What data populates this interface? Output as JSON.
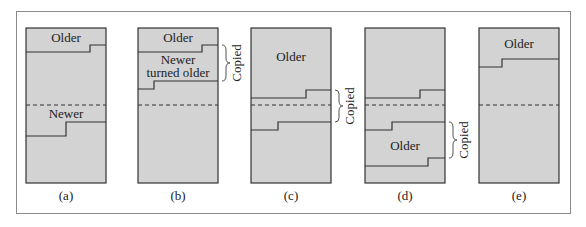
{
  "figure": {
    "fill_color": "#d3d3d3",
    "line_color": "#333333",
    "panels": [
      {
        "id": "a",
        "caption": "(a)",
        "labels": [
          "Older",
          "Newer"
        ],
        "copied_label": ""
      },
      {
        "id": "b",
        "caption": "(b)",
        "labels": [
          "Older",
          "Newer",
          "turned older"
        ],
        "copied_label": "Copied"
      },
      {
        "id": "c",
        "caption": "(c)",
        "labels": [
          "Older"
        ],
        "copied_label": "Copied"
      },
      {
        "id": "d",
        "caption": "(d)",
        "labels": [
          "Older"
        ],
        "copied_label": "Copied"
      },
      {
        "id": "e",
        "caption": "(e)",
        "labels": [
          "Older"
        ],
        "copied_label": ""
      }
    ]
  }
}
